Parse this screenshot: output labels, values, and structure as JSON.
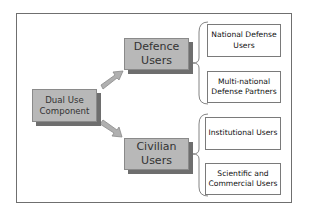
{
  "diagram": {
    "type": "hierarchy",
    "root": {
      "label_line1": "Dual Use",
      "label_line2": "Component"
    },
    "categories": [
      {
        "label_line1": "Defence",
        "label_line2": "Users",
        "children": [
          {
            "label_line1": "National Defense",
            "label_line2": "Users"
          },
          {
            "label_line1": "Multi-national",
            "label_line2": "Defense Partners"
          }
        ]
      },
      {
        "label_line1": "Civilian",
        "label_line2": "Users",
        "children": [
          {
            "label_line1": "Institutional Users",
            "label_line2": ""
          },
          {
            "label_line1": "Scientific and",
            "label_line2": "Commercial Users"
          }
        ]
      }
    ],
    "colors": {
      "box_fill": "#b8b8b8",
      "box_shadow": "#6e6e6e",
      "arrow_fill": "#b0b0b0",
      "frame": "#6f6f6f"
    }
  }
}
